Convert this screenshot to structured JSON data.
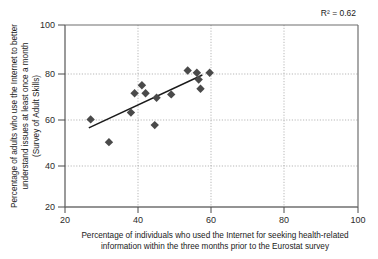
{
  "chart_data": {
    "type": "scatter",
    "title": "",
    "xlabel": "Percentage of individuals who used the Internet for seeking health-related information within the three months prior to the Eurostat survey",
    "xlabel_line1": "Percentage of individuals who used the Internet for seeking health-related",
    "xlabel_line2": "information within the three months prior to the Eurostat survey",
    "ylabel": "Percentage of adults who use the Internet to better understand issues at least once a month (Survey of Adult Skills)",
    "ylabel_line1": "Percentage of adults who use the Internet to better",
    "ylabel_line2": "understand issues at least once a month",
    "ylabel_line3": "(Survey of Adult Skills)",
    "xlim": [
      20,
      100
    ],
    "ylim": [
      20,
      100
    ],
    "xticks": [
      20,
      40,
      60,
      80,
      100
    ],
    "yticks": [
      20,
      40,
      60,
      80,
      100
    ],
    "grid": true,
    "legend": "none",
    "annotation": "R² = 0.62",
    "r_squared": 0.62,
    "marker": "diamond",
    "marker_color": "#4a4a4a",
    "trendline": {
      "visible": true,
      "color": "#1a1a1a",
      "x_start": 26.5,
      "y_start": 54.8,
      "x_end": 57.5,
      "y_end": 78.0
    },
    "points": [
      {
        "x": 27.0,
        "y": 58.5
      },
      {
        "x": 32.0,
        "y": 48.5
      },
      {
        "x": 38.0,
        "y": 61.5
      },
      {
        "x": 39.0,
        "y": 70.0
      },
      {
        "x": 41.0,
        "y": 73.5
      },
      {
        "x": 42.0,
        "y": 70.0
      },
      {
        "x": 44.5,
        "y": 56.0
      },
      {
        "x": 45.0,
        "y": 68.0
      },
      {
        "x": 49.0,
        "y": 69.5
      },
      {
        "x": 53.5,
        "y": 80.0
      },
      {
        "x": 56.0,
        "y": 79.0
      },
      {
        "x": 56.5,
        "y": 76.0
      },
      {
        "x": 57.0,
        "y": 72.0
      },
      {
        "x": 59.5,
        "y": 79.0
      }
    ]
  }
}
